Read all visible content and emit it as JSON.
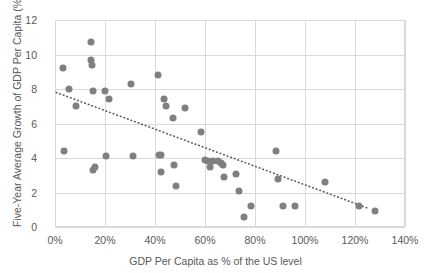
{
  "chart_data": {
    "type": "scatter",
    "title": "",
    "xlabel": "GDP Per Capita as % of the US level",
    "ylabel": "Five-Year Average Growth of GDP Per Capita (%)",
    "xlim": [
      0,
      140
    ],
    "ylim": [
      0,
      12
    ],
    "xticks": [
      "0%",
      "20%",
      "40%",
      "60%",
      "80%",
      "100%",
      "120%",
      "140%"
    ],
    "xtick_values": [
      0,
      20,
      40,
      60,
      80,
      100,
      120,
      140
    ],
    "yticks": [
      "0",
      "2",
      "4",
      "6",
      "8",
      "10",
      "12"
    ],
    "ytick_values": [
      0,
      2,
      4,
      6,
      8,
      10,
      12
    ],
    "grid": true,
    "legend": "none",
    "marker_color": "#7f7f7f",
    "gridline_color": "#d9d9d9",
    "points": [
      [
        3.0,
        9.2
      ],
      [
        3.5,
        4.4
      ],
      [
        5.5,
        8.0
      ],
      [
        8.5,
        7.0
      ],
      [
        14.5,
        10.7
      ],
      [
        14.5,
        9.7
      ],
      [
        14.8,
        9.4
      ],
      [
        15.0,
        7.9
      ],
      [
        15.0,
        3.3
      ],
      [
        16.0,
        3.5
      ],
      [
        20.0,
        7.9
      ],
      [
        20.5,
        4.1
      ],
      [
        21.5,
        7.4
      ],
      [
        30.5,
        8.3
      ],
      [
        31.0,
        4.1
      ],
      [
        41.0,
        8.8
      ],
      [
        41.5,
        4.2
      ],
      [
        42.5,
        4.2
      ],
      [
        42.5,
        3.2
      ],
      [
        43.5,
        7.4
      ],
      [
        44.5,
        7.0
      ],
      [
        47.0,
        6.3
      ],
      [
        47.5,
        3.6
      ],
      [
        48.5,
        2.4
      ],
      [
        52.0,
        6.9
      ],
      [
        58.5,
        5.5
      ],
      [
        60.0,
        3.9
      ],
      [
        61.0,
        3.8
      ],
      [
        62.0,
        3.5
      ],
      [
        63.0,
        3.8
      ],
      [
        65.0,
        3.8
      ],
      [
        66.5,
        3.7
      ],
      [
        67.0,
        3.6
      ],
      [
        67.5,
        2.9
      ],
      [
        72.5,
        3.1
      ],
      [
        73.5,
        2.1
      ],
      [
        75.5,
        0.6
      ],
      [
        78.5,
        1.2
      ],
      [
        88.5,
        4.4
      ],
      [
        89.0,
        2.8
      ],
      [
        91.0,
        1.2
      ],
      [
        96.0,
        1.2
      ],
      [
        108.0,
        2.6
      ],
      [
        121.5,
        1.2
      ],
      [
        128.0,
        0.9
      ]
    ],
    "trendline": {
      "style": "dotted",
      "color": "#595959",
      "x_start": 0.5,
      "y_start": 7.8,
      "x_end": 125.0,
      "y_end": 1.1
    }
  }
}
